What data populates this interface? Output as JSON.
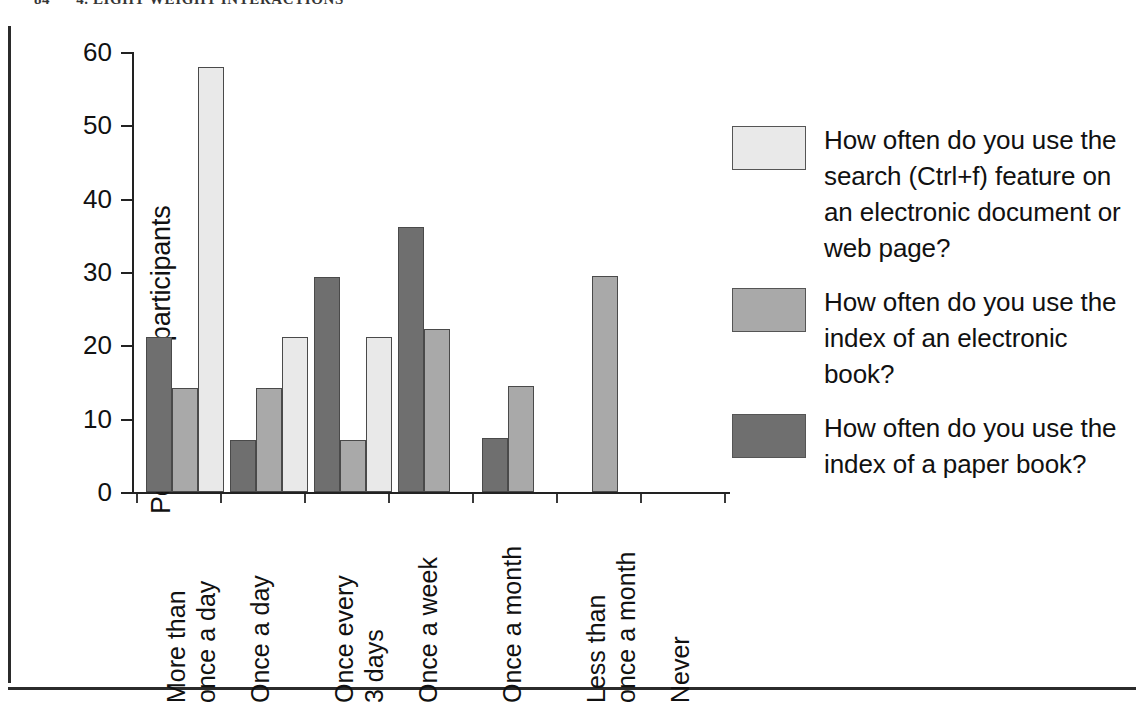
{
  "page": {
    "running_header_folio": "84",
    "running_header_title": "4. LIGHT WEIGHT INTERACTIONS"
  },
  "chart_data": {
    "type": "bar",
    "title": "",
    "xlabel": "",
    "ylabel": "Percentage of participants",
    "ylim": [
      0,
      60
    ],
    "yticks": [
      0,
      10,
      20,
      30,
      40,
      50,
      60
    ],
    "ytick_labels": [
      "0",
      "10",
      "20",
      "30",
      "40",
      "50",
      "60"
    ],
    "grid": false,
    "legend_position": "right",
    "grouping": "grouped",
    "categories": [
      "More than once a day",
      "Once a day",
      "Once every 3 days",
      "Once a week",
      "Once a month",
      "Less than once a month",
      "Never"
    ],
    "category_lines": [
      [
        "More than",
        "once a day"
      ],
      [
        "Once a day",
        ""
      ],
      [
        "Once every",
        "3 days"
      ],
      [
        "Once a week",
        ""
      ],
      [
        "Once a month",
        ""
      ],
      [
        "Less than",
        "once a month"
      ],
      [
        "Never",
        ""
      ]
    ],
    "series": [
      {
        "name": "How often do you use the search (Ctrl+f) feature on an electronic document or web page?",
        "short_name": "search-ctrl-f",
        "color": "#e9e9e9",
        "values": [
          58.0,
          21.2,
          21.2,
          0,
          0,
          0,
          0
        ]
      },
      {
        "name": "How often do you use the index of an electronic book?",
        "short_name": "index-electronic-book",
        "color": "#a9a9a9",
        "values": [
          14.2,
          14.2,
          7.1,
          22.2,
          14.4,
          29.5,
          0
        ]
      },
      {
        "name": "How often do you use the index of a paper book?",
        "short_name": "index-paper-book",
        "color": "#6f6f6f",
        "values": [
          21.2,
          7.1,
          29.3,
          36.2,
          7.3,
          0,
          0
        ]
      }
    ],
    "draw_order": [
      "index-paper-book",
      "index-electronic-book",
      "search-ctrl-f"
    ]
  },
  "legend": {
    "items": [
      {
        "color": "#e9e9e9",
        "label": "How often do you use the search (Ctrl+f) feature on an electronic document or web page?"
      },
      {
        "color": "#a9a9a9",
        "label": "How often do you use the index of an electronic book?"
      },
      {
        "color": "#6f6f6f",
        "label": "How often do you use the index of a paper book?"
      }
    ]
  }
}
